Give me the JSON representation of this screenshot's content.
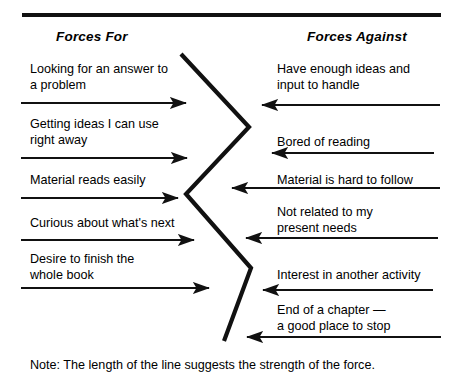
{
  "diagram": {
    "title_note": "Note: The length of the line suggests the strength of the force.",
    "headers": {
      "left": "Forces For",
      "right": "Forces Against"
    },
    "type": "force-field-analysis",
    "center_divider": {
      "name": "zigzag-divider",
      "points": "181,54 249,127 186,194 251,268 224,341"
    }
  },
  "forces_for": [
    {
      "label": "Looking for an answer to\na problem",
      "label_x": 30,
      "label_y": 62,
      "arrow_y": 103,
      "arrow_start_x": 21,
      "arrow_end_x": 186,
      "length": 165,
      "direction": "right"
    },
    {
      "label": "Getting ideas I can use\nright away",
      "label_x": 30,
      "label_y": 117,
      "arrow_y": 158,
      "arrow_start_x": 21,
      "arrow_end_x": 187,
      "length": 166,
      "direction": "right"
    },
    {
      "label": "Material reads easily",
      "label_x": 30,
      "label_y": 173,
      "arrow_y": 198,
      "arrow_start_x": 21,
      "arrow_end_x": 178,
      "length": 157,
      "direction": "right"
    },
    {
      "label": "Curious about what's next",
      "label_x": 30,
      "label_y": 216,
      "arrow_y": 240,
      "arrow_start_x": 21,
      "arrow_end_x": 194,
      "length": 173,
      "direction": "right"
    },
    {
      "label": "Desire to finish the\nwhole book",
      "label_x": 30,
      "label_y": 252,
      "arrow_y": 288,
      "arrow_start_x": 21,
      "arrow_end_x": 209,
      "length": 188,
      "direction": "right"
    }
  ],
  "forces_against": [
    {
      "label": "Have enough ideas and\ninput to handle",
      "label_x": 277,
      "label_y": 62,
      "arrow_y": 105,
      "arrow_start_x": 440,
      "arrow_end_x": 262,
      "length": 178,
      "direction": "left"
    },
    {
      "label": "Bored of reading",
      "label_x": 277,
      "label_y": 135,
      "arrow_y": 153,
      "arrow_start_x": 434,
      "arrow_end_x": 272,
      "length": 162,
      "direction": "left"
    },
    {
      "label": "Material is hard to follow",
      "label_x": 277,
      "label_y": 173,
      "arrow_y": 188,
      "arrow_start_x": 440,
      "arrow_end_x": 232,
      "length": 208,
      "direction": "left"
    },
    {
      "label": "Not related to my\npresent needs",
      "label_x": 277,
      "label_y": 205,
      "arrow_y": 238,
      "arrow_start_x": 438,
      "arrow_end_x": 246,
      "length": 192,
      "direction": "left"
    },
    {
      "label": "Interest in another activity",
      "label_x": 277,
      "label_y": 268,
      "arrow_y": 290,
      "arrow_start_x": 433,
      "arrow_end_x": 263,
      "length": 170,
      "direction": "left"
    },
    {
      "label": "End of a chapter —\na good place to stop",
      "label_x": 277,
      "label_y": 303,
      "arrow_y": 337,
      "arrow_start_x": 441,
      "arrow_end_x": 247,
      "length": 194,
      "direction": "left"
    }
  ],
  "chart_data": {
    "type": "bar",
    "xlabel": "Relative strength (line length in px)",
    "ylabel": "",
    "series": [
      {
        "name": "Forces For",
        "categories": [
          "Looking for an answer to a problem",
          "Getting ideas I can use right away",
          "Material reads easily",
          "Curious about what's next",
          "Desire to finish the whole book"
        ],
        "values": [
          165,
          166,
          157,
          173,
          188
        ]
      },
      {
        "name": "Forces Against",
        "categories": [
          "Have enough ideas and input to handle",
          "Bored of reading",
          "Material is hard to follow",
          "Not related to my present needs",
          "Interest in another activity",
          "End of a chapter — a good place to stop"
        ],
        "values": [
          178,
          162,
          208,
          192,
          170,
          194
        ]
      }
    ]
  }
}
